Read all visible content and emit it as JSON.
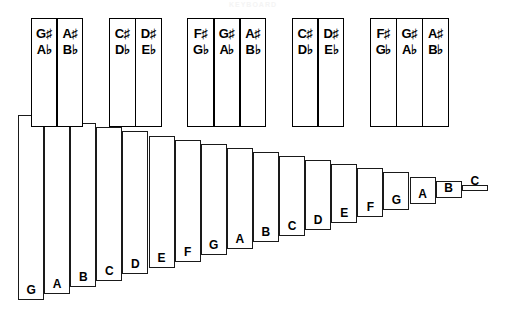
{
  "title": "KEYBOARD",
  "diagram": {
    "type": "piano-keyboard",
    "white_key_count": 18,
    "black_key_count": 12,
    "geometry": {
      "white_key_left_start": 18,
      "white_key_width": 26.1,
      "white_key_top_start": 115,
      "white_key_top_step": 4.1,
      "white_key_bottom_start": 300,
      "white_key_bottom_step": -6.4,
      "black_key_top": 18,
      "black_key_bottom": 127,
      "black_key_width": 26.5
    },
    "colors": {
      "outline": "#000000",
      "key_fill": "#ffffff",
      "label": "#000000"
    }
  },
  "white_keys": [
    {
      "label": "G"
    },
    {
      "label": "A"
    },
    {
      "label": "B"
    },
    {
      "label": "C"
    },
    {
      "label": "D"
    },
    {
      "label": "E"
    },
    {
      "label": "F"
    },
    {
      "label": "G"
    },
    {
      "label": "A"
    },
    {
      "label": "B"
    },
    {
      "label": "C"
    },
    {
      "label": "D"
    },
    {
      "label": "E"
    },
    {
      "label": "F"
    },
    {
      "label": "G"
    },
    {
      "label": "A"
    },
    {
      "label": "B"
    },
    {
      "label": "C"
    }
  ],
  "black_key_groups": [
    {
      "group": 1,
      "keys": [
        {
          "sharp": "G♯",
          "flat": "A♭",
          "sharp_letter": "G",
          "flat_letter": "A"
        },
        {
          "sharp": "A♯",
          "flat": "B♭",
          "sharp_letter": "A",
          "flat_letter": "B"
        }
      ]
    },
    {
      "group": 2,
      "keys": [
        {
          "sharp": "C♯",
          "flat": "D♭",
          "sharp_letter": "C",
          "flat_letter": "D"
        },
        {
          "sharp": "D♯",
          "flat": "E♭",
          "sharp_letter": "D",
          "flat_letter": "E"
        }
      ]
    },
    {
      "group": 3,
      "keys": [
        {
          "sharp": "F♯",
          "flat": "G♭",
          "sharp_letter": "F",
          "flat_letter": "G"
        },
        {
          "sharp": "G♯",
          "flat": "A♭",
          "sharp_letter": "G",
          "flat_letter": "A"
        },
        {
          "sharp": "A♯",
          "flat": "B♭",
          "sharp_letter": "A",
          "flat_letter": "B"
        }
      ]
    },
    {
      "group": 4,
      "keys": [
        {
          "sharp": "C♯",
          "flat": "D♭",
          "sharp_letter": "C",
          "flat_letter": "D"
        },
        {
          "sharp": "D♯",
          "flat": "E♭",
          "sharp_letter": "D",
          "flat_letter": "E"
        }
      ]
    },
    {
      "group": 5,
      "keys": [
        {
          "sharp": "F♯",
          "flat": "G♭",
          "sharp_letter": "F",
          "flat_letter": "G"
        },
        {
          "sharp": "G♯",
          "flat": "A♭",
          "sharp_letter": "G",
          "flat_letter": "A"
        },
        {
          "sharp": "A♯",
          "flat": "B♭",
          "sharp_letter": "A",
          "flat_letter": "B"
        }
      ]
    }
  ],
  "black_keys_flat": [
    {
      "sharp": "G♯",
      "flat": "A♭",
      "after_white_index": 0
    },
    {
      "sharp": "A♯",
      "flat": "B♭",
      "after_white_index": 1
    },
    {
      "sharp": "C♯",
      "flat": "D♭",
      "after_white_index": 3
    },
    {
      "sharp": "D♯",
      "flat": "E♭",
      "after_white_index": 4
    },
    {
      "sharp": "F♯",
      "flat": "G♭",
      "after_white_index": 6
    },
    {
      "sharp": "G♯",
      "flat": "A♭",
      "after_white_index": 7
    },
    {
      "sharp": "A♯",
      "flat": "B♭",
      "after_white_index": 8
    },
    {
      "sharp": "C♯",
      "flat": "D♭",
      "after_white_index": 10
    },
    {
      "sharp": "D♯",
      "flat": "E♭",
      "after_white_index": 11
    },
    {
      "sharp": "F♯",
      "flat": "G♭",
      "after_white_index": 13
    },
    {
      "sharp": "G♯",
      "flat": "A♭",
      "after_white_index": 14
    },
    {
      "sharp": "A♯",
      "flat": "B♭",
      "after_white_index": 15
    }
  ]
}
